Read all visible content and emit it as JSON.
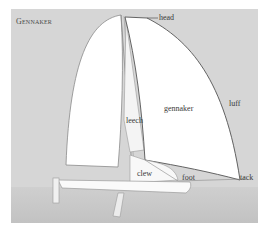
{
  "diagram": {
    "title": "Gennaker",
    "labels": {
      "head": "head",
      "gennaker": "gennaker",
      "luff": "luff",
      "leech": "leech",
      "clew": "clew",
      "foot": "foot",
      "tack": "tack"
    },
    "colors": {
      "background": "#d6d6d6",
      "water": "#c4c4c4",
      "sail": "#ffffff",
      "outline": "#6a6a6a"
    }
  }
}
